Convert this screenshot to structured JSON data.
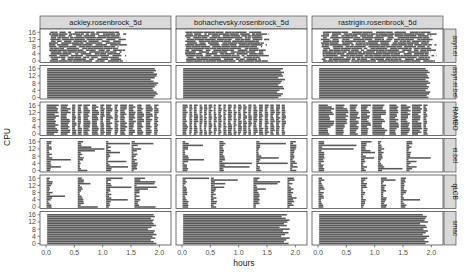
{
  "chart_data": {
    "type": "bar",
    "subtype": "gantt-facet-grid",
    "title": "",
    "xlabel": "hours",
    "ylabel": "CPU",
    "xlim": [
      0,
      2.1
    ],
    "ylim": [
      0,
      17
    ],
    "x_ticks": [
      "0.0",
      "0.5",
      "1.0",
      "1.5",
      "2.0"
    ],
    "x_tick_values": [
      0,
      0.5,
      1.0,
      1.5,
      2.0
    ],
    "y_ticks": [
      "0",
      "4",
      "8",
      "12",
      "16"
    ],
    "y_tick_values": [
      0,
      4,
      8,
      12,
      16
    ],
    "grid": false,
    "legend": "none",
    "bar_color": "#595959",
    "columns": [
      "ackley.rosenbrock_5d",
      "bohachevsky.rosenbrock_5d",
      "rastrigin.rosenbrock_5d"
    ],
    "rows": [
      "asyn.ei",
      "asyn.ei.bel",
      "RAMBO",
      "ei.bel",
      "qLCB",
      "smac"
    ],
    "panels": {
      "asyn.ei": {
        "pattern": "async-fragmented",
        "end_hours": [
          [
            1.28,
            1.33
          ],
          [
            1.35,
            1.45
          ],
          [
            1.95,
            2.0
          ]
        ],
        "gap_density": [
          0.25,
          0.18,
          0.22
        ]
      },
      "asyn.ei.bel": {
        "pattern": "continuous",
        "end_hours_by_col": [
          [
            1.9,
            1.93,
            1.97,
            1.95,
            1.9,
            1.88,
            1.92,
            1.95,
            1.98,
            1.9,
            1.85,
            1.92,
            1.95,
            1.96,
            1.9,
            1.94,
            1.92
          ],
          [
            1.7,
            1.75,
            1.78,
            1.68,
            1.72,
            1.8,
            1.78,
            1.7,
            1.74,
            1.76,
            1.82,
            1.7,
            1.78,
            1.76,
            1.8,
            1.74,
            1.78
          ],
          [
            1.95,
            1.92,
            1.96,
            1.98,
            1.9,
            1.94,
            1.96,
            1.92,
            1.98,
            1.95,
            1.9,
            1.96,
            1.94,
            1.92,
            1.97,
            1.94,
            1.9
          ]
        ]
      },
      "RAMBO": {
        "pattern": "synchronous-batches",
        "batch_boundaries_by_col": [
          [
            0.0,
            0.25,
            0.45,
            0.55,
            0.65,
            0.8,
            0.95,
            1.05,
            1.2,
            1.3,
            1.45,
            1.6,
            1.75,
            1.9,
            2.0
          ],
          [
            0.0,
            0.12,
            0.2,
            0.3,
            0.38,
            0.46,
            0.55,
            0.63,
            0.72,
            0.8,
            0.9,
            0.98,
            1.07,
            1.16,
            1.25,
            1.35,
            1.45,
            1.55,
            1.65,
            1.75,
            1.85
          ],
          [
            0.0,
            0.3,
            0.55,
            0.75,
            0.95,
            1.25,
            1.45,
            1.65,
            1.85,
            1.95
          ]
        ]
      },
      "ei.bel": {
        "pattern": "synchronous-sparse",
        "batch_starts_by_col": [
          [
            0.0,
            0.55,
            1.05,
            1.5
          ],
          [
            0.0,
            0.65,
            1.3,
            1.9
          ],
          [
            0.0,
            0.75,
            1.05,
            1.55
          ]
        ]
      },
      "qLCB": {
        "pattern": "synchronous-sparse",
        "batch_starts_by_col": [
          [
            0.0,
            0.55,
            1.05,
            1.55
          ],
          [
            0.0,
            0.5,
            1.25,
            1.85
          ],
          [
            0.0,
            0.75,
            1.1,
            1.45
          ]
        ]
      },
      "smac": {
        "pattern": "continuous",
        "end_hours_by_col": [
          [
            1.95,
            1.9,
            1.85,
            1.93,
            1.88,
            1.95,
            1.9,
            1.92,
            1.8,
            1.86,
            1.94,
            1.9,
            1.88,
            1.9,
            1.85,
            1.92,
            1.9
          ],
          [
            1.88,
            1.8,
            1.84,
            1.9,
            1.75,
            1.82,
            1.88,
            1.78,
            1.9,
            1.72,
            1.85,
            1.8,
            1.86,
            1.9,
            1.83,
            1.76,
            1.85
          ],
          [
            1.9,
            1.95,
            1.88,
            1.92,
            1.96,
            1.85,
            1.9,
            1.94,
            1.86,
            1.92,
            1.9,
            1.8,
            1.94,
            1.88,
            1.9,
            1.92,
            1.85
          ]
        ]
      }
    }
  },
  "colors": {
    "bar": "#595959",
    "panel_border": "#333333",
    "strip_fill": "#d9d9d9",
    "strip_border": "#333333",
    "text": "#1a1a1a",
    "tick_text": "#4d4d4d",
    "background": "#ffffff"
  }
}
